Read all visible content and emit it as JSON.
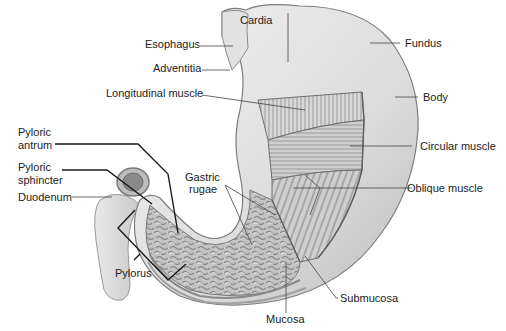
{
  "diagram": {
    "labels": {
      "cardia": "Cardia",
      "esophagus": "Esophagus",
      "adventitia": "Adventitia",
      "longitudinal_muscle": "Longitudinal muscle",
      "fundus": "Fundus",
      "body": "Body",
      "pyloric_antrum_l1": "Pyloric",
      "pyloric_antrum_l2": "antrum",
      "pyloric_sphincter_l1": "Pyloric",
      "pyloric_sphincter_l2": "sphincter",
      "duodenum": "Duodenum",
      "circular_muscle": "Circular muscle",
      "gastric_rugae_l1": "Gastric",
      "gastric_rugae_l2": "rugae",
      "oblique_muscle": "Oblique muscle",
      "pylorus": "Pylorus",
      "submucosa": "Submucosa",
      "mucosa": "Mucosa"
    },
    "colors": {
      "tissue_light": "#e6e6e6",
      "tissue_mid": "#c8c8c8",
      "tissue_dark": "#8a8a8a",
      "leader_line": "#222222",
      "leader_line_thin": "#444444"
    }
  }
}
